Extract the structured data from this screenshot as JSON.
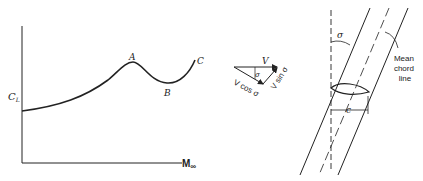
{
  "left_plot": {
    "y_label": "C",
    "y_label_sub": "L",
    "x_label": "M",
    "x_label_sub": "∞",
    "points": [
      {
        "label": "A"
      },
      {
        "label": "B"
      },
      {
        "label": "C"
      }
    ]
  },
  "vector_diagram": {
    "v_label": "V",
    "sigma_label": "σ",
    "cos_label": "V cos σ",
    "sin_label": "V sin σ"
  },
  "wing_diagram": {
    "sigma_label": "σ",
    "chord_label": "c",
    "mean_chord_label": [
      "Mean",
      "chord",
      "line"
    ]
  },
  "colors": {
    "ink": "#222222",
    "background": "#ffffff"
  }
}
